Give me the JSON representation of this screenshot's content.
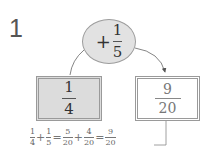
{
  "problem": {
    "number": "1",
    "operator": {
      "sign": "+",
      "fraction": {
        "numerator": "1",
        "denominator": "5"
      }
    },
    "start": {
      "numerator": "1",
      "denominator": "4"
    },
    "result": {
      "numerator": "9",
      "denominator": "20"
    },
    "equation": [
      {
        "type": "frac",
        "numerator": "1",
        "denominator": "4"
      },
      {
        "type": "op",
        "value": "+"
      },
      {
        "type": "frac",
        "numerator": "1",
        "denominator": "5"
      },
      {
        "type": "op",
        "value": "="
      },
      {
        "type": "frac",
        "numerator": "5",
        "denominator": "20"
      },
      {
        "type": "op",
        "value": "+"
      },
      {
        "type": "frac",
        "numerator": "4",
        "denominator": "20"
      },
      {
        "type": "op",
        "value": "="
      },
      {
        "type": "frac",
        "numerator": "9",
        "denominator": "20"
      }
    ]
  },
  "colors": {
    "shaded_fill": "#dcdcdc",
    "ellipse_fill": "#e2e2e2",
    "border": "#9a9a9a",
    "answer_text": "#777777"
  }
}
